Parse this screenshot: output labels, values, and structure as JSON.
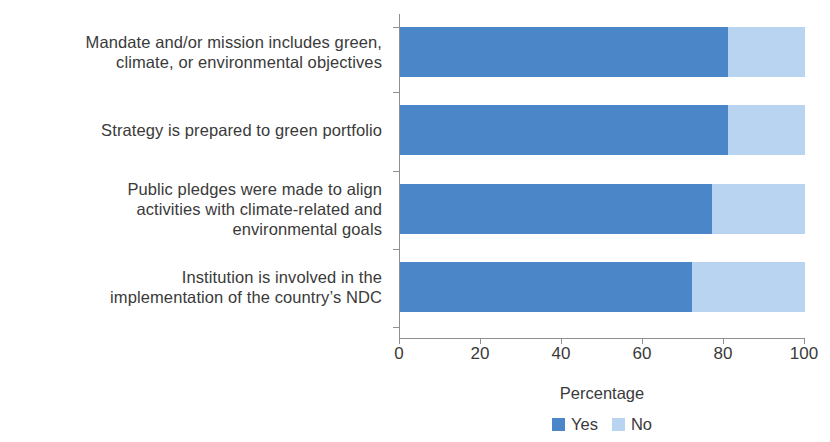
{
  "chart_data": {
    "type": "bar",
    "orientation": "horizontal",
    "stacked": true,
    "stack_total": 100,
    "title": "",
    "xlabel": "Percentage",
    "ylabel": "",
    "xlim": [
      0,
      100
    ],
    "xticks": [
      "0",
      "20",
      "40",
      "60",
      "80",
      "100"
    ],
    "grid": false,
    "legend_position": "bottom",
    "categories": [
      "Mandate and/or mission includes green, climate, or environmental objectives",
      "Strategy is prepared to green portfolio",
      "Public pledges were made to align activities with climate-related and environmental goals",
      "Institution is involved in the implementation of the country’s NDC"
    ],
    "category_lines": [
      [
        "Mandate and/or mission includes green,",
        "climate, or environmental objectives"
      ],
      [
        "Strategy is prepared to green portfolio"
      ],
      [
        "Public pledges were made to align",
        "activities with climate-related and",
        "environmental goals"
      ],
      [
        "Institution is involved in the",
        "implementation of the country’s NDC"
      ]
    ],
    "series": [
      {
        "name": "Yes",
        "color": "#4a86c8",
        "values": [
          81,
          81,
          77,
          72
        ]
      },
      {
        "name": "No",
        "color": "#b8d4f0",
        "values": [
          19,
          19,
          23,
          28
        ]
      }
    ]
  },
  "legend": {
    "items": [
      {
        "label": "Yes",
        "color": "#4a86c8"
      },
      {
        "label": "No",
        "color": "#b8d4f0"
      }
    ]
  },
  "colors": {
    "yes": "#4a86c8",
    "no": "#b8d4f0",
    "text": "#3a3a3a",
    "axis": "#909090",
    "background": "#ffffff"
  }
}
